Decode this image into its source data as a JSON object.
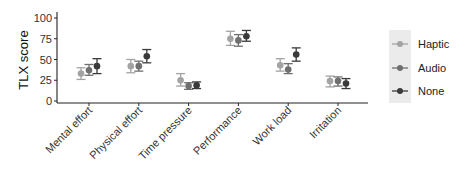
{
  "chart_data": {
    "type": "scatter",
    "subtype": "point-with-error-bars",
    "title": "",
    "xlabel": "",
    "ylabel": "TLX score",
    "ylim": [
      0,
      100
    ],
    "yticks": [
      0,
      25,
      50,
      75,
      100
    ],
    "grid": false,
    "legend_position": "right",
    "categories": [
      "Mental effort",
      "Physical effort",
      "Time pressure",
      "Performance",
      "Work load",
      "Irritation"
    ],
    "series": [
      {
        "name": "Haptic",
        "color": "#a3a3a3",
        "values": [
          33,
          42,
          25,
          75,
          43,
          24
        ],
        "lower": [
          26,
          34,
          18,
          67,
          36,
          17
        ],
        "upper": [
          40,
          50,
          33,
          84,
          51,
          30
        ]
      },
      {
        "name": "Audio",
        "color": "#6f6f6f",
        "values": [
          37,
          42,
          18,
          73,
          38,
          24
        ],
        "lower": [
          31,
          36,
          14,
          66,
          33,
          18
        ],
        "upper": [
          44,
          48,
          22,
          80,
          45,
          29
        ]
      },
      {
        "name": "None",
        "color": "#3a3a3a",
        "values": [
          42,
          54,
          19,
          78,
          56,
          21
        ],
        "lower": [
          33,
          46,
          15,
          72,
          48,
          15
        ],
        "upper": [
          51,
          62,
          23,
          85,
          64,
          27
        ]
      }
    ]
  },
  "legend": {
    "items": [
      "Haptic",
      "Audio",
      "None"
    ]
  }
}
